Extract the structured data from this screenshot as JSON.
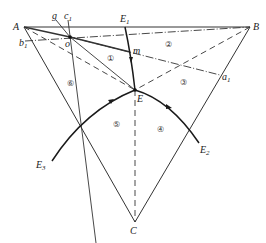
{
  "diagram": {
    "vertices": {
      "A": "A",
      "B": "B",
      "C": "C"
    },
    "points": {
      "E": "E",
      "E1": "E",
      "E1_sub": "1",
      "E2": "E",
      "E2_sub": "2",
      "E3": "E",
      "E3_sub": "3",
      "o": "o",
      "m": "m",
      "g": "g",
      "c1": "c",
      "c1_sub": "1",
      "b1": "b",
      "b1_sub": "1",
      "a1": "a",
      "a1_sub": "1"
    },
    "regions": [
      "①",
      "②",
      "③",
      "④",
      "⑤",
      "⑥"
    ],
    "colors": {
      "line": "#333333",
      "curve": "#1a1a1a"
    }
  }
}
